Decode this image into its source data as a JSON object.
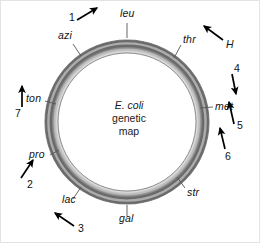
{
  "figure": {
    "title_lines": {
      "species": "E. coli",
      "line2": "genetic",
      "line3": "map"
    },
    "ring": {
      "center_x": 126,
      "center_y": 121,
      "outer_radius": 82,
      "ring_thickness": 13,
      "color_light": "#d4d4d4",
      "color_mid": "#a8a8a8",
      "color_dark": "#6e6e6e"
    },
    "gene_markers": [
      {
        "name": "leu",
        "label": "leu",
        "x": 119,
        "y": 11,
        "angle_deg": 90
      },
      {
        "name": "thr",
        "label": "thr",
        "x": 182,
        "y": 37,
        "angle_deg": 55
      },
      {
        "name": "met",
        "label": "met",
        "x": 214,
        "y": 103,
        "angle_deg": 2
      },
      {
        "name": "str",
        "label": "str",
        "x": 186,
        "y": 190,
        "angle_deg": -50
      },
      {
        "name": "gal",
        "label": "gal",
        "x": 118,
        "y": 215,
        "angle_deg": -90
      },
      {
        "name": "lac",
        "label": "lac",
        "x": 61,
        "y": 196,
        "angle_deg": -126
      },
      {
        "name": "pro",
        "label": "pro",
        "x": 28,
        "y": 150,
        "angle_deg": -162
      },
      {
        "name": "ton",
        "label": "ton",
        "x": 25,
        "y": 95,
        "angle_deg": 170
      },
      {
        "name": "azi",
        "label": "azi",
        "x": 57,
        "y": 33,
        "angle_deg": 126
      }
    ],
    "transfer_markers": [
      {
        "name": "marker-1",
        "label": "1",
        "x": 68,
        "y": 11,
        "arrow_direction": "up-right"
      },
      {
        "name": "marker-H",
        "label": "H",
        "x": 225,
        "y": 42,
        "arrow_direction": "up-left"
      },
      {
        "name": "marker-4",
        "label": "4",
        "x": 233,
        "y": 66,
        "arrow_direction": "down"
      },
      {
        "name": "marker-5",
        "label": "5",
        "x": 235,
        "y": 123,
        "arrow_direction": "up"
      },
      {
        "name": "marker-6",
        "label": "6",
        "x": 224,
        "y": 149,
        "arrow_direction": "up"
      },
      {
        "name": "marker-3",
        "label": "3",
        "x": 77,
        "y": 225,
        "arrow_direction": "up-left"
      },
      {
        "name": "marker-2",
        "label": "2",
        "x": 26,
        "y": 176,
        "arrow_direction": "up-right"
      },
      {
        "name": "marker-7",
        "label": "7",
        "x": 14,
        "y": 105,
        "arrow_direction": "up"
      }
    ],
    "colors": {
      "background": "#ffffff",
      "text": "#111111",
      "arrow": "#000000",
      "leader_line": "#555555",
      "frame": "#e3e3e3"
    }
  }
}
